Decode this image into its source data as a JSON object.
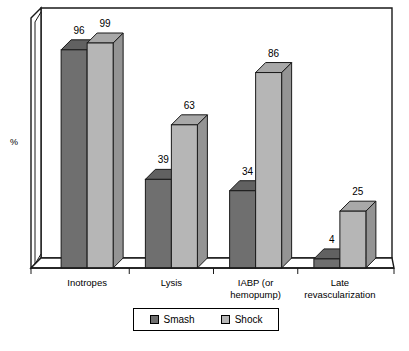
{
  "chart_data": {
    "type": "bar",
    "title": "",
    "subtitle": "",
    "xlabel": "",
    "ylabel": "%",
    "ylim": [
      0,
      110
    ],
    "grid": false,
    "legend_position": "bottom",
    "categories": [
      "Inotropes",
      "Lysis",
      "IABP (or\nhemopump)",
      "Late\nrevascularization"
    ],
    "series": [
      {
        "name": "Smash",
        "color": "#6f6f6f",
        "values": [
          96,
          39,
          34,
          4
        ],
        "labels": [
          "96",
          "39",
          "34",
          "4"
        ]
      },
      {
        "name": "Shock",
        "color": "#b6b6b6",
        "values": [
          99,
          63,
          86,
          25
        ],
        "labels": [
          "99",
          "63",
          "86",
          "25"
        ]
      }
    ],
    "annotations": []
  },
  "axes": {
    "y_unit_label": "%"
  },
  "legend": {
    "entries": [
      {
        "label": "Smash",
        "color": "#6f6f6f"
      },
      {
        "label": "Shock",
        "color": "#b6b6b6"
      }
    ]
  }
}
